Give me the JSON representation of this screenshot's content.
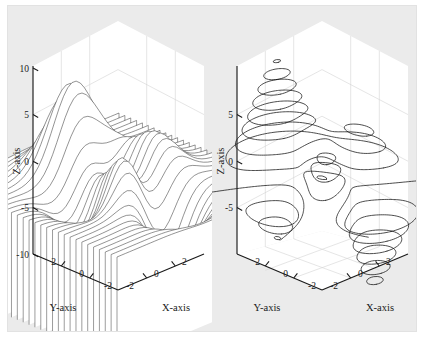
{
  "figure": {
    "background_color": "#ebebeb",
    "page_color": "#ffffff",
    "panel_count": 2
  },
  "chart_data": [
    {
      "type": "line",
      "subtype": "3d-waterfall-surface",
      "title": "",
      "xlabel": "X-axis",
      "ylabel": "Y-axis",
      "zlabel": "Z-axis",
      "xlim": [
        -3,
        3
      ],
      "ylim": [
        -3,
        3
      ],
      "zlim": [
        -10,
        10
      ],
      "xticks": [
        -2,
        0,
        2
      ],
      "yticks": [
        2,
        0,
        -2
      ],
      "zticks": [
        10,
        5,
        0,
        -5,
        -10
      ],
      "xticklabels": [
        "-2",
        "0",
        "2"
      ],
      "yticklabels": [
        "2",
        "0",
        "-2"
      ],
      "zticklabels": [
        "10",
        "5",
        "0",
        "-5",
        "-10"
      ],
      "grid": true,
      "legend": "none",
      "function": "peaks",
      "description": "Waterfall (meshz) rendering of the MATLAB peaks surface: z = 3(1-x)^2 e^(-x^2-(y+1)^2) - 10(x/5 - x^3 - y^5) e^(-x^2-y^2) - 1/3 e^(-(x+1)^2-y^2)",
      "z_range_observed": [
        -6.5,
        8.1
      ],
      "line_color": "#333333",
      "fill_color": "#ffffff"
    },
    {
      "type": "line",
      "subtype": "3d-contour",
      "title": "",
      "xlabel": "X-axis",
      "ylabel": "Y-axis",
      "zlabel": "Z-axis",
      "xlim": [
        -3,
        3
      ],
      "ylim": [
        -3,
        3
      ],
      "zlim": [
        -8,
        8
      ],
      "xticks": [
        -2,
        0,
        2
      ],
      "yticks": [
        2,
        0,
        -2
      ],
      "zticks": [
        5,
        0,
        -5
      ],
      "xticklabels": [
        "-2",
        "0",
        "2"
      ],
      "yticklabels": [
        "2",
        "0",
        "-2"
      ],
      "zticklabels": [
        "5",
        "0",
        "-5"
      ],
      "grid": true,
      "legend": "none",
      "function": "peaks",
      "description": "contour3 rendering of the MATLAB peaks surface, contour lines drawn at their z levels",
      "contour_levels": [
        -6,
        -5,
        -4,
        -3,
        -2,
        -1,
        0,
        1,
        2,
        3,
        4,
        5,
        6,
        7,
        8
      ],
      "line_color": "#111111"
    }
  ],
  "panels": [
    {
      "name": "left-plot",
      "axis_labels": {
        "x": "X-axis",
        "y": "Y-axis",
        "z": "Z-axis"
      },
      "z_ticks": [
        "10",
        "5",
        "0",
        "-5",
        "-10"
      ],
      "y_ticks": [
        "2",
        "0",
        "-2"
      ],
      "x_ticks": [
        "-2",
        "0",
        "2"
      ]
    },
    {
      "name": "right-plot",
      "axis_labels": {
        "x": "X-axis",
        "y": "Y-axis",
        "z": "Z-axis"
      },
      "z_ticks": [
        "5",
        "0",
        "-5"
      ],
      "y_ticks": [
        "2",
        "0",
        "-2"
      ],
      "x_ticks": [
        "-2",
        "0",
        "2"
      ]
    }
  ]
}
